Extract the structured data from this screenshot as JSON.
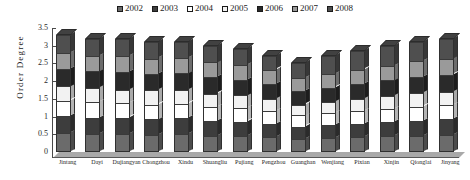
{
  "legend": {
    "position": "top-center",
    "entries": [
      {
        "label": "2002",
        "color": "#6b6b6b"
      },
      {
        "label": "2003",
        "color": "#3d3d3d"
      },
      {
        "label": "2004",
        "color": "#ffffff"
      },
      {
        "label": "2005",
        "color": "#f2f2f2"
      },
      {
        "label": "2006",
        "color": "#2a2a2a"
      },
      {
        "label": "2007",
        "color": "#9a9a9a"
      },
      {
        "label": "2008",
        "color": "#4f4f4f"
      }
    ]
  },
  "axes": {
    "ylabel": "Order Degree",
    "yticks": [
      "3.5",
      "3",
      "2.5",
      "2",
      "1.5",
      "1",
      "0.5",
      "0"
    ],
    "ylim": [
      0,
      3.5
    ],
    "grid": false
  },
  "chart_data": {
    "type": "bar",
    "subtype": "stacked-column-3d",
    "title": "",
    "xlabel": "",
    "ylabel": "Order Degree",
    "ylim": [
      0,
      3.5
    ],
    "grid": false,
    "legend_position": "top-center",
    "categories": [
      "Jintang",
      "Dayi",
      "Dujiangyan",
      "Chongzhou",
      "Xindu",
      "Shuangliu",
      "Pujiang",
      "Pengzhou",
      "Guanghan",
      "Wenjiang",
      "Pixian",
      "Xinjin",
      "Qionglai",
      "Jinyang"
    ],
    "series": [
      {
        "name": "2002",
        "color": "#6b6b6b",
        "values": [
          0.55,
          0.5,
          0.52,
          0.48,
          0.5,
          0.45,
          0.46,
          0.42,
          0.38,
          0.4,
          0.42,
          0.44,
          0.46,
          0.48
        ]
      },
      {
        "name": "2003",
        "color": "#3d3d3d",
        "values": [
          0.48,
          0.46,
          0.45,
          0.44,
          0.46,
          0.42,
          0.4,
          0.38,
          0.34,
          0.36,
          0.38,
          0.4,
          0.42,
          0.44
        ]
      },
      {
        "name": "2004",
        "color": "#ffffff",
        "values": [
          0.42,
          0.44,
          0.4,
          0.42,
          0.4,
          0.4,
          0.38,
          0.36,
          0.32,
          0.34,
          0.36,
          0.38,
          0.4,
          0.4
        ]
      },
      {
        "name": "2005",
        "color": "#f2f2f2",
        "values": [
          0.4,
          0.4,
          0.38,
          0.4,
          0.38,
          0.38,
          0.36,
          0.34,
          0.3,
          0.32,
          0.34,
          0.36,
          0.38,
          0.38
        ]
      },
      {
        "name": "2006",
        "color": "#2a2a2a",
        "values": [
          0.5,
          0.48,
          0.5,
          0.46,
          0.48,
          0.46,
          0.44,
          0.42,
          0.38,
          0.4,
          0.42,
          0.44,
          0.46,
          0.48
        ]
      },
      {
        "name": "2007",
        "color": "#9a9a9a",
        "values": [
          0.45,
          0.44,
          0.46,
          0.44,
          0.44,
          0.42,
          0.42,
          0.4,
          0.36,
          0.38,
          0.4,
          0.42,
          0.44,
          0.46
        ]
      },
      {
        "name": "2008",
        "color": "#4f4f4f",
        "values": [
          0.5,
          0.48,
          0.49,
          0.46,
          0.44,
          0.47,
          0.44,
          0.38,
          0.42,
          0.5,
          0.52,
          0.56,
          0.54,
          0.56
        ]
      }
    ],
    "totals": [
      3.3,
      3.2,
      3.2,
      3.1,
      3.1,
      3.0,
      2.9,
      2.7,
      2.5,
      2.7,
      2.84,
      3.0,
      3.1,
      3.2
    ]
  }
}
